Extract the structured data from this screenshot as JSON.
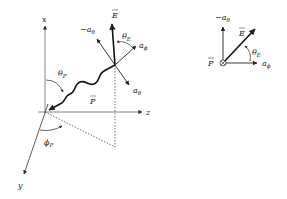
{
  "left_diagram": {
    "axes": {
      "x_label": "x",
      "y_label": "y",
      "z_label": "z"
    },
    "vectors": {
      "E_label": "E",
      "neg_a_theta_label": "−a",
      "neg_a_theta_sub": "θ",
      "a_phi_label": "a",
      "a_phi_sub": "ϕ",
      "a_theta_label": "a",
      "a_theta_sub": "θ",
      "P_label": "P"
    },
    "angles": {
      "theta_E": "θ",
      "theta_E_sub": "E",
      "theta_P": "θ",
      "theta_P_sub": "P",
      "phi_P": "ϕ",
      "phi_P_sub": "P"
    }
  },
  "right_diagram": {
    "neg_a_theta_label": "−a",
    "neg_a_theta_sub": "θ",
    "E_label": "E",
    "theta_E": "θ",
    "theta_E_sub": "E",
    "P_label": "P",
    "into_page_symbol": "⊗",
    "a_phi_label": "a",
    "a_phi_sub": "ϕ"
  },
  "colors": {
    "ink": "#222222",
    "axis": "#555555"
  }
}
